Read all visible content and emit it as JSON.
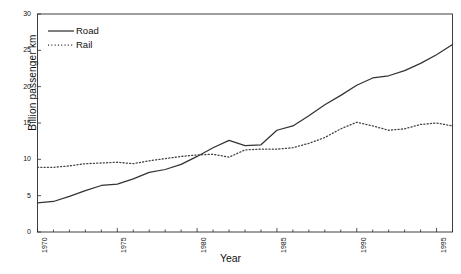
{
  "chart_data": {
    "type": "line",
    "title": "",
    "xlabel": "Year",
    "ylabel": "Billion passenger km",
    "xlim": [
      1970,
      1996
    ],
    "ylim": [
      0,
      30
    ],
    "yticks": [
      0,
      5,
      10,
      15,
      20,
      25,
      30
    ],
    "xticks": [
      1970,
      1975,
      1980,
      1985,
      1990,
      1995
    ],
    "xtick_labels": [
      "1970",
      "1975",
      "1980",
      "1985",
      "1990",
      "1995"
    ],
    "ytick_labels": [
      "0",
      "5",
      "10",
      "15",
      "20",
      "25",
      "30"
    ],
    "grid": false,
    "legend_position": "top-left",
    "x": [
      1970,
      1971,
      1972,
      1973,
      1974,
      1975,
      1976,
      1977,
      1978,
      1979,
      1980,
      1981,
      1982,
      1983,
      1984,
      1985,
      1986,
      1987,
      1988,
      1989,
      1990,
      1991,
      1992,
      1993,
      1994,
      1995,
      1996
    ],
    "series": [
      {
        "name": "Road",
        "style": "solid",
        "color": "#333333",
        "values": [
          4.0,
          4.2,
          4.9,
          5.7,
          6.4,
          6.6,
          7.3,
          8.2,
          8.6,
          9.3,
          10.4,
          11.6,
          12.6,
          11.9,
          12.0,
          14.0,
          14.6,
          16.0,
          17.5,
          18.8,
          20.2,
          21.2,
          21.5,
          22.2,
          23.2,
          24.4,
          25.8
        ]
      },
      {
        "name": "Rail",
        "style": "dotted",
        "color": "#444444",
        "values": [
          8.9,
          8.9,
          9.1,
          9.4,
          9.5,
          9.6,
          9.4,
          9.8,
          10.1,
          10.4,
          10.6,
          10.7,
          10.3,
          11.3,
          11.4,
          11.4,
          11.6,
          12.2,
          13.0,
          14.2,
          15.1,
          14.6,
          14.0,
          14.2,
          14.8,
          15.0,
          14.6
        ]
      }
    ]
  },
  "legend": {
    "items": [
      {
        "label": "Road",
        "style": "solid"
      },
      {
        "label": "Rail",
        "style": "dotted"
      }
    ]
  }
}
